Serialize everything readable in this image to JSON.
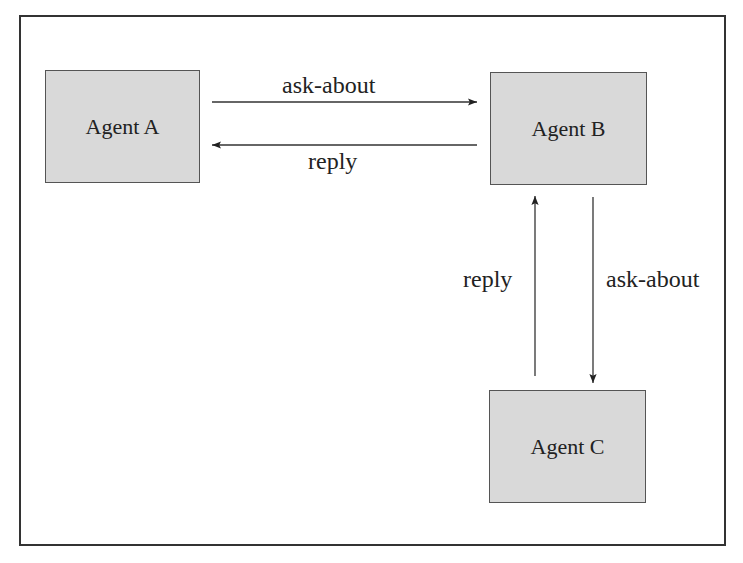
{
  "diagram": {
    "type": "agent-communication",
    "frame": {
      "border_color": "#333333"
    },
    "nodes": [
      {
        "id": "A",
        "label": "Agent A",
        "fill": "#d9d9d9"
      },
      {
        "id": "B",
        "label": "Agent B",
        "fill": "#d9d9d9"
      },
      {
        "id": "C",
        "label": "Agent C",
        "fill": "#d9d9d9"
      }
    ],
    "edges": [
      {
        "from": "A",
        "to": "B",
        "label": "ask-about"
      },
      {
        "from": "B",
        "to": "A",
        "label": "reply"
      },
      {
        "from": "B",
        "to": "C",
        "label": "ask-about"
      },
      {
        "from": "C",
        "to": "B",
        "label": "reply"
      }
    ]
  }
}
